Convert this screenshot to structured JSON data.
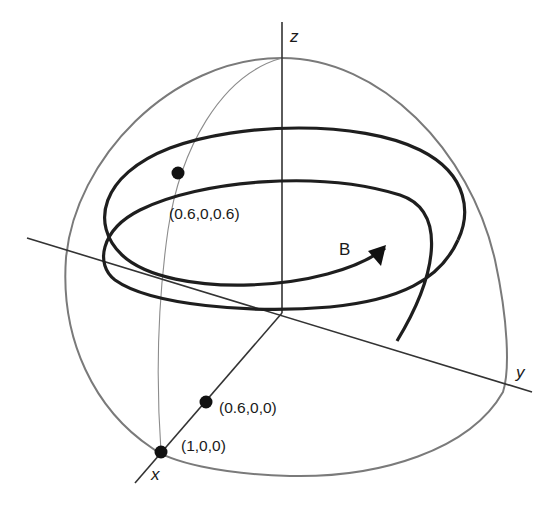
{
  "figure": {
    "type": "3d-diagram",
    "axes": {
      "x_label": "x",
      "y_label": "y",
      "z_label": "z"
    },
    "points": [
      {
        "label": "(0.6,0,0.6)"
      },
      {
        "label": "(0.6,0,0)"
      },
      {
        "label": "(1,0,0)"
      }
    ],
    "vector_label": "B",
    "colors": {
      "sphere_outline": "#7a7a7a",
      "meridian": "#8c8c8c",
      "axes": "#333333",
      "helix": "#1e1e1e",
      "points": "#111111",
      "background": "#ffffff"
    }
  }
}
